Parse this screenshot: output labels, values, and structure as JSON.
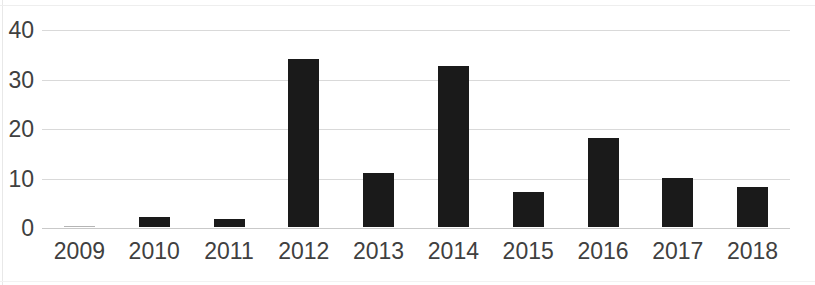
{
  "chart_data": {
    "type": "bar",
    "title": "",
    "xlabel": "",
    "ylabel": "",
    "categories": [
      "2009",
      "2010",
      "2011",
      "2012",
      "2013",
      "2014",
      "2015",
      "2016",
      "2017",
      "2018"
    ],
    "values": [
      0.2,
      2,
      1.6,
      34,
      11,
      32.5,
      7,
      18,
      10,
      8
    ],
    "ylim": [
      0,
      40
    ],
    "ytick_labels": [
      "0",
      "10",
      "20",
      "30",
      "40"
    ],
    "ytick_values": [
      0,
      10,
      20,
      30,
      40
    ],
    "grid": true,
    "legend": false,
    "bar_color": "#1a1a1a",
    "grid_color": "#d9d9d9",
    "axis_text_color": "#404040"
  }
}
